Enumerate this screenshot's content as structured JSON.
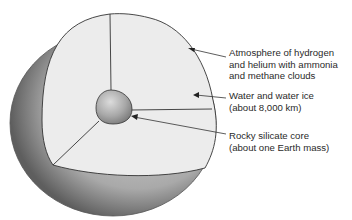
{
  "diagram": {
    "type": "planet-interior-cutaway",
    "labels": [
      {
        "id": "atmosphere",
        "lines": [
          "Atmosphere of hydrogen",
          "and helium with ammonia",
          "and methane clouds"
        ]
      },
      {
        "id": "water",
        "lines": [
          "Water and water ice",
          "(about 8,000 km)"
        ]
      },
      {
        "id": "core",
        "lines": [
          "Rocky silicate core",
          "(about one Earth mass)"
        ]
      }
    ],
    "colors": {
      "cut_face": "#ececec",
      "outer_shell_dark": "#6e6e6e",
      "outer_shell_light": "#bdbdbd",
      "core": "#b0b0b0",
      "line": "#333333",
      "text": "#2a2a2a"
    }
  }
}
